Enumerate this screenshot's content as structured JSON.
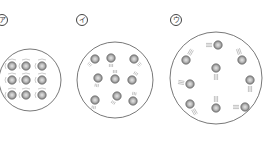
{
  "diagram": {
    "panels": [
      {
        "label": "ア",
        "state": "solid",
        "container": {
          "cx": 30,
          "cy": 80,
          "r": 31
        },
        "particles": [
          {
            "x": 12,
            "y": 66
          },
          {
            "x": 26,
            "y": 66
          },
          {
            "x": 42,
            "y": 66
          },
          {
            "x": 12,
            "y": 80
          },
          {
            "x": 26,
            "y": 80
          },
          {
            "x": 42,
            "y": 80
          },
          {
            "x": 12,
            "y": 95
          },
          {
            "x": 26,
            "y": 95
          },
          {
            "x": 42,
            "y": 95
          }
        ],
        "motion": "vibration"
      },
      {
        "label": "イ",
        "state": "liquid",
        "container": {
          "cx": 115,
          "cy": 80,
          "r": 38
        },
        "particles": [
          {
            "x": 95,
            "y": 59
          },
          {
            "x": 111,
            "y": 58
          },
          {
            "x": 134,
            "y": 59
          },
          {
            "x": 98,
            "y": 78
          },
          {
            "x": 115,
            "y": 79
          },
          {
            "x": 132,
            "y": 80
          },
          {
            "x": 95,
            "y": 100
          },
          {
            "x": 117,
            "y": 96
          },
          {
            "x": 133,
            "y": 101
          }
        ],
        "motion": "moving"
      },
      {
        "label": "ウ",
        "state": "gas",
        "container": {
          "cx": 216,
          "cy": 78,
          "r": 46
        },
        "particles": [
          {
            "x": 218,
            "y": 45
          },
          {
            "x": 186,
            "y": 60
          },
          {
            "x": 242,
            "y": 60
          },
          {
            "x": 216,
            "y": 68
          },
          {
            "x": 250,
            "y": 80
          },
          {
            "x": 190,
            "y": 84
          },
          {
            "x": 190,
            "y": 104
          },
          {
            "x": 216,
            "y": 108
          },
          {
            "x": 245,
            "y": 107
          }
        ],
        "motion": "fast-moving"
      }
    ],
    "colors": {
      "outline": "#555555",
      "particle_rim": "#777777",
      "particle_fill": "#b8b8b8",
      "particle_core": "#e0e0e0",
      "motion_lines": "#999999"
    }
  }
}
